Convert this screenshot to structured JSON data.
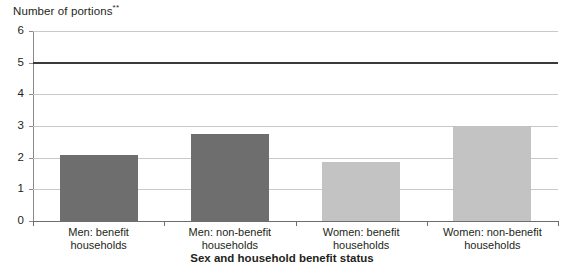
{
  "chart_data": {
    "type": "bar",
    "title": "",
    "ylabel": "Number of portions",
    "ylabel_superscript": "**",
    "xlabel": "Sex and household benefit status",
    "categories": [
      "Men: benefit households",
      "Men: non-benefit households",
      "Women: benefit households",
      "Women: non-benefit households"
    ],
    "category_lines": [
      [
        "Men: benefit",
        "households"
      ],
      [
        "Men: non-benefit",
        "households"
      ],
      [
        "Women: benefit",
        "households"
      ],
      [
        "Women: non-benefit",
        "households"
      ]
    ],
    "values": [
      2.1,
      2.75,
      1.85,
      3.0
    ],
    "bar_colors": [
      "#6e6e6e",
      "#6e6e6e",
      "#c3c3c3",
      "#c3c3c3"
    ],
    "ylim": [
      0,
      6
    ],
    "yticks": [
      0,
      1,
      2,
      3,
      4,
      5,
      6
    ],
    "ytick_labels": [
      "0",
      "1",
      "2",
      "3",
      "4",
      "5",
      "6"
    ],
    "grid": true,
    "legend": "none",
    "reference_line": {
      "value": 5,
      "color": "#3a3a3a"
    },
    "colors": {
      "grid": "#c9c9c9",
      "axis": "#6d6d6d",
      "text": "#231f20",
      "bar_dark": "#6e6e6e",
      "bar_light": "#c3c3c3"
    }
  }
}
